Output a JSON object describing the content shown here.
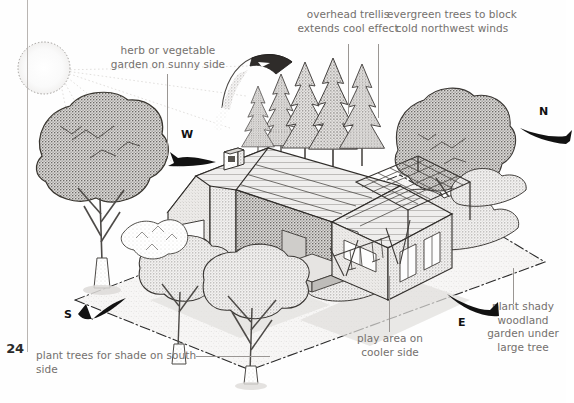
{
  "page": {
    "number": "24",
    "rule_color": "#b9b5b2",
    "background": "#fefefe",
    "caption_color": "#74706d",
    "ink_color": "#1d1d1d"
  },
  "captions": [
    {
      "id": "herb-garden",
      "text": "herb or vegetable\ngarden on sunny side",
      "align": "center"
    },
    {
      "id": "overhead-trellis",
      "text": "overhead trellis\nextends cool effect",
      "align": "center"
    },
    {
      "id": "evergreen-windbreak",
      "text": "evergreen trees to block\ncold northwest winds",
      "align": "center"
    },
    {
      "id": "plant-trees-south",
      "text": "plant trees for shade on south side",
      "align": "left"
    },
    {
      "id": "play-area",
      "text": "play area on\ncooler side",
      "align": "center"
    },
    {
      "id": "woodland-garden",
      "text": "plant shady\nwoodland\ngarden under\nlarge tree",
      "align": "center"
    }
  ],
  "compass": {
    "west": "W",
    "north": "N",
    "east": "E",
    "south": "S"
  },
  "scene": {
    "title": "Residential site plan with climate-responsive planting",
    "elements": [
      "sun",
      "deciduous-shade-tree-southwest",
      "deciduous-shade-trees-south",
      "conifer-windbreak-north",
      "large-deciduous-tree-northeast",
      "house-with-garage",
      "overhead-trellis",
      "swing-set-play-area",
      "shrub-hedge-border",
      "property-boundary"
    ]
  }
}
